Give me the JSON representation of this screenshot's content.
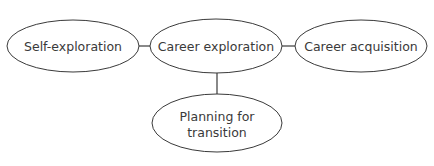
{
  "diagram": {
    "type": "flow-ellipses",
    "stroke_color": "#3a3a3a",
    "text_color": "#3a3a3a",
    "nodes": [
      {
        "id": "self-exploration",
        "label": "Self-exploration",
        "lines": [
          "Self-exploration"
        ],
        "cx": 73,
        "cy": 46,
        "rx": 66,
        "ry": 26
      },
      {
        "id": "career-exploration",
        "label": "Career exploration",
        "lines": [
          "Career exploration"
        ],
        "cx": 216,
        "cy": 46,
        "rx": 66,
        "ry": 27
      },
      {
        "id": "career-acquisition",
        "label": "Career acquisition",
        "lines": [
          "Career acquisition"
        ],
        "cx": 361,
        "cy": 46,
        "rx": 66,
        "ry": 26
      },
      {
        "id": "planning-for-transition",
        "label": "Planning for transition",
        "lines": [
          "Planning for",
          "transition"
        ],
        "cx": 217,
        "cy": 123,
        "rx": 65,
        "ry": 29
      }
    ],
    "edges": [
      {
        "from": "self-exploration",
        "to": "career-exploration"
      },
      {
        "from": "career-exploration",
        "to": "career-acquisition"
      },
      {
        "from": "career-exploration",
        "to": "planning-for-transition"
      }
    ]
  }
}
